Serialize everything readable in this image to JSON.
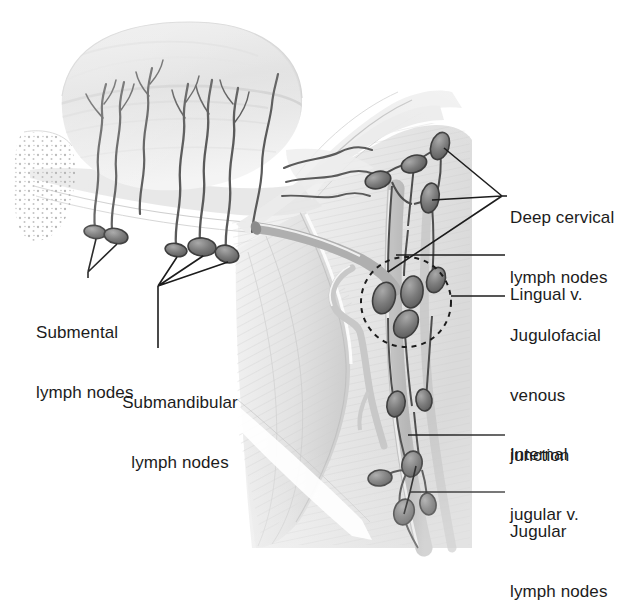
{
  "figure": {
    "background_color": "#ffffff",
    "ink_color": "#1c1c1c",
    "node_fill": "#7d7d7d",
    "node_stroke": "#3a3a3a",
    "tissue_light": "#f2f2f2",
    "tissue_mid": "#dcdcdc",
    "tissue_dark": "#b8b8b8"
  },
  "labels": {
    "deep_cervical": {
      "line1": "Deep cervical",
      "line2": "lymph nodes"
    },
    "lingual_vein": {
      "line1": "Lingual v."
    },
    "jugulofacial": {
      "line1": "Jugulofacial",
      "line2": "venous",
      "line3": "junction"
    },
    "internal_jugular": {
      "line1": "Internal",
      "line2": "jugular v."
    },
    "jugular_nodes": {
      "line1": "Jugular",
      "line2": "lymph nodes"
    },
    "submental": {
      "line1": "Submental",
      "line2": "lymph nodes"
    },
    "submandibular": {
      "line1": "Submandibular",
      "line2": "lymph nodes"
    }
  },
  "structures": {
    "tongue": "tongue-dorsum",
    "mandible": "mandible-cut-surface-stippled",
    "lymph_vessels": "wavy-lymphatic-collectors",
    "internal_jugular_vein": "internal-jugular-vein",
    "lingual_vein": "lingual-vein",
    "facial_vein": "facial-vein",
    "dashed_circle": "jugulofacial-venous-junction-highlight"
  },
  "node_counts": {
    "submental": 2,
    "submandibular": 3,
    "deep_cervical": 4,
    "jugulofacial": 4,
    "jugular": 4
  }
}
